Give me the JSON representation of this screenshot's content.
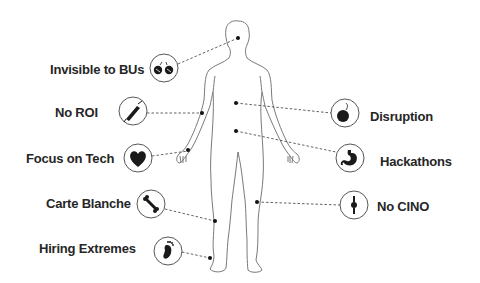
{
  "diagram": {
    "type": "body-map",
    "figure": "human-body-outline",
    "colors": {
      "line": "#555555",
      "text": "#262626",
      "icon": "#1a1a1a",
      "background": "#ffffff"
    },
    "left_labels": [
      {
        "text": "Invisible to BUs",
        "icon": "glasses-icon",
        "body_part": "head"
      },
      {
        "text": "No ROI",
        "icon": "syringe-icon",
        "body_part": "upper-arm"
      },
      {
        "text": "Focus on Tech",
        "icon": "heart-icon",
        "body_part": "hand"
      },
      {
        "text": "Carte Blanche",
        "icon": "bone-icon",
        "body_part": "thigh"
      },
      {
        "text": "Hiring Extremes",
        "icon": "foot-icon",
        "body_part": "ankle"
      }
    ],
    "right_labels": [
      {
        "text": "Disruption",
        "icon": "bomb-icon",
        "body_part": "chest"
      },
      {
        "text": "Hackathons",
        "icon": "stomach-icon",
        "body_part": "abdomen"
      },
      {
        "text": "No CINO",
        "icon": "knee-joint-icon",
        "body_part": "knee"
      }
    ]
  }
}
